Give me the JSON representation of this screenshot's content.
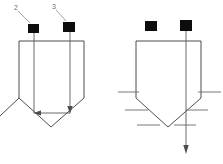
{
  "figure": {
    "background_color": "#ffffff",
    "line_color": "#4d4d4d",
    "marker_color": "#0d0d0d",
    "label_color": "#6f6f6f",
    "canvas": {
      "width": 223,
      "height": 164
    }
  },
  "callouts": [
    {
      "id": "callout-2",
      "text": "2",
      "x": 14,
      "y": 10
    },
    {
      "id": "callout-3",
      "text": "3",
      "x": 52,
      "y": 9
    }
  ],
  "left_diagram": {
    "name": "left-vessel-diagram",
    "outline_points": "19,41 84,41 84,98 51,127 19,98",
    "extension_line": {
      "x1": 0,
      "y1": 116,
      "x2": 19,
      "y2": 98
    },
    "markers": [
      {
        "id": "left-marker-a",
        "x": 28,
        "y": 24,
        "width": 11,
        "height": 9
      },
      {
        "id": "left-marker-b",
        "x": 63,
        "y": 22,
        "width": 12,
        "height": 10
      }
    ],
    "vertical_dimension_up": {
      "x": 34,
      "y_top": 27,
      "y_bottom": 113,
      "arrow": "up"
    },
    "vertical_dimension_down": {
      "x": 70,
      "y_top": 30,
      "y_bottom": 112,
      "arrow": "down"
    },
    "horizontal_dimension": {
      "y": 113,
      "x_left": 35,
      "x_right": 70,
      "arrow": "left"
    },
    "leaders": [
      {
        "id": "leader-2",
        "x1": 18,
        "y1": 11,
        "x2": 30,
        "y2": 23
      },
      {
        "id": "leader-3",
        "x1": 56,
        "y1": 10,
        "x2": 66,
        "y2": 21
      }
    ]
  },
  "right_diagram": {
    "name": "right-vessel-diagram",
    "outline_points": "136,41 201,41 201,98 168,127 136,98",
    "markers": [
      {
        "id": "right-marker-a",
        "x": 145,
        "y": 21,
        "width": 12,
        "height": 10
      },
      {
        "id": "right-marker-b",
        "x": 180,
        "y": 20,
        "width": 12,
        "height": 11
      }
    ],
    "vertical_dimension_down": {
      "x": 186,
      "y_top": 30,
      "y_bottom": 152,
      "arrow": "down"
    },
    "tick_pairs": [
      {
        "id": "tick-level-1",
        "y": 92,
        "left_x1": 118,
        "left_x2": 139,
        "right_x1": 198,
        "right_x2": 221
      },
      {
        "id": "tick-level-2",
        "y": 110,
        "left_x1": 125,
        "left_x2": 148,
        "right_x1": 186,
        "right_x2": 208
      },
      {
        "id": "tick-level-3",
        "y": 125,
        "left_x1": 137,
        "left_x2": 160,
        "right_x1": 174,
        "right_x2": 196
      }
    ]
  }
}
